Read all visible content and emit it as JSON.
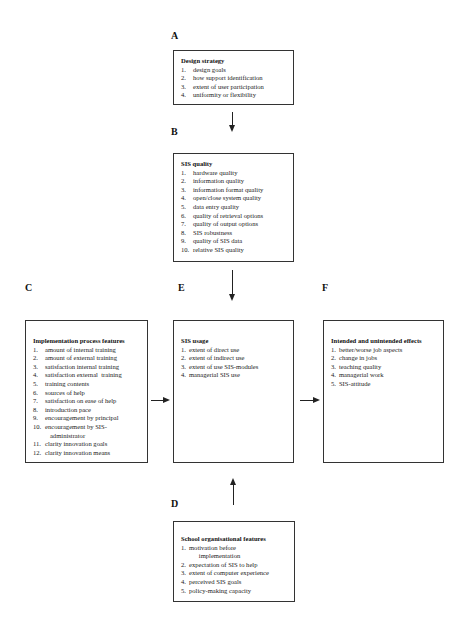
{
  "labels": {
    "A": "A",
    "B": "B",
    "C": "C",
    "D": "D",
    "E": "E",
    "F": "F"
  },
  "boxes": {
    "A": {
      "title": "Design strategy",
      "items": [
        {
          "num": "1.",
          "text": "design goals"
        },
        {
          "num": "2.",
          "text": "how support identification"
        },
        {
          "num": "3.",
          "text": "extent of user participation"
        },
        {
          "num": "4.",
          "text": "uniformity or flexibility"
        }
      ]
    },
    "B": {
      "title": "SIS quality",
      "items": [
        {
          "num": "1.",
          "text": "hardware quality"
        },
        {
          "num": "2.",
          "text": "information quality"
        },
        {
          "num": "3.",
          "text": "information format quality"
        },
        {
          "num": "4.",
          "text": "open/close system quality"
        },
        {
          "num": "5.",
          "text": "data entry quality"
        },
        {
          "num": "6.",
          "text": "quality of retrieval options"
        },
        {
          "num": "7.",
          "text": "quality of output options"
        },
        {
          "num": "8.",
          "text": "SIS robustness"
        },
        {
          "num": "9.",
          "text": "quality of SIS data"
        },
        {
          "num": "10.",
          "text": "relative SIS quality"
        }
      ]
    },
    "C": {
      "title": "Implementation process features",
      "items": [
        {
          "num": "1.",
          "text": "amount of internal training"
        },
        {
          "num": "2.",
          "text": "amount of external training"
        },
        {
          "num": "3.",
          "text": "satisfaction internal training"
        },
        {
          "num": "4.",
          "text": "satisfaction external  training"
        },
        {
          "num": "5.",
          "text": "training contents"
        },
        {
          "num": "6.",
          "text": "sources of help"
        },
        {
          "num": "7.",
          "text": "satisfaction on ease of help"
        },
        {
          "num": "8.",
          "text": "introduction pace"
        },
        {
          "num": "9.",
          "text": "encouragement by principal"
        },
        {
          "num": "10.",
          "text": "encouragement by SIS-\n   administrator"
        },
        {
          "num": "11.",
          "text": "clarity innovation goals"
        },
        {
          "num": "12.",
          "text": "clarity innovation means"
        }
      ]
    },
    "E": {
      "title": "SIS usage",
      "items": [
        {
          "num": "1.",
          "text": "extent of direct use"
        },
        {
          "num": "2.",
          "text": "extent of indirect use"
        },
        {
          "num": "3.",
          "text": "extent of use SIS-modules"
        },
        {
          "num": "4.",
          "text": "managerial SIS use"
        }
      ]
    },
    "F": {
      "title": "Intended and unintended effects",
      "items": [
        {
          "num": "1.",
          "text": "better/worse job aspects"
        },
        {
          "num": "2.",
          "text": "change in jobs"
        },
        {
          "num": "3.",
          "text": "teaching quality"
        },
        {
          "num": "4.",
          "text": "managerial work"
        },
        {
          "num": "5.",
          "text": "SIS-attitude"
        }
      ]
    },
    "D": {
      "title": "School organisational features",
      "items": [
        {
          "num": "1.",
          "text": "motivation before\n      implementation"
        },
        {
          "num": "2.",
          "text": "expectation of SIS to help"
        },
        {
          "num": "3.",
          "text": "extent of computer experience"
        },
        {
          "num": "4.",
          "text": "perceived SIS goals"
        },
        {
          "num": "5.",
          "text": "policy-making capacity"
        }
      ]
    }
  },
  "edges": [
    {
      "from": "A",
      "to": "B"
    },
    {
      "from": "B",
      "to": "E"
    },
    {
      "from": "C",
      "to": "E"
    },
    {
      "from": "E",
      "to": "F"
    },
    {
      "from": "D",
      "to": "E"
    }
  ]
}
